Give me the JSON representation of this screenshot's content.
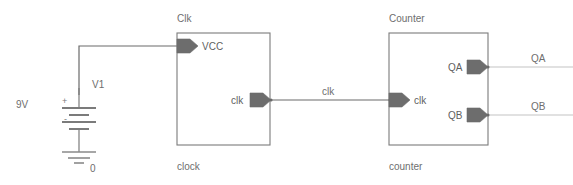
{
  "diagram": {
    "title_visible": false,
    "type": "circuit-schematic",
    "colors": {
      "background": "#ffffff",
      "block_stroke": "#7b7b7b",
      "pin_fill": "#6d6d6d",
      "wire_dark": "#6a6a6a",
      "wire_light": "#c4c4c4",
      "text": "#6e6e6e"
    }
  },
  "source": {
    "voltage_label": "9V",
    "reference_designator": "V1",
    "plus_terminal": "+",
    "minus_terminal": "-",
    "ground_label": "0",
    "ground_symbol": "earth-ground"
  },
  "blocks": [
    {
      "id": "clk",
      "instance_label": "Clk",
      "type_label": "clock",
      "pins": [
        {
          "name": "VCC",
          "side": "left",
          "direction": "input"
        },
        {
          "name": "clk",
          "side": "right",
          "direction": "output"
        }
      ]
    },
    {
      "id": "counter",
      "instance_label": "Counter",
      "type_label": "counter",
      "pins": [
        {
          "name": "clk",
          "side": "left",
          "direction": "input"
        },
        {
          "name": "QA",
          "side": "right",
          "direction": "output"
        },
        {
          "name": "QB",
          "side": "right",
          "direction": "output"
        }
      ]
    }
  ],
  "nets": [
    {
      "name": "",
      "label": "",
      "from": "V1.+",
      "to": "Clk.VCC",
      "style": "dark"
    },
    {
      "name": "clk",
      "label": "clk",
      "from": "Clk.clk",
      "to": "Counter.clk",
      "style": "dark"
    },
    {
      "name": "QA",
      "label": "QA",
      "from": "Counter.QA",
      "to": "open",
      "style": "light"
    },
    {
      "name": "QB",
      "label": "QB",
      "from": "Counter.QB",
      "to": "open",
      "style": "light"
    }
  ]
}
